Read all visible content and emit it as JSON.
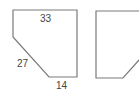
{
  "diagram": {
    "shapes": [
      {
        "id": "shape-1",
        "points": [
          [
            13,
            10
          ],
          [
            77,
            10
          ],
          [
            77,
            77
          ],
          [
            49,
            77
          ],
          [
            13,
            37
          ]
        ],
        "labels": [
          {
            "text": "33",
            "x": 40,
            "y": 22,
            "edge": "top"
          },
          {
            "text": "27",
            "x": 17,
            "y": 67,
            "edge": "diagonal"
          },
          {
            "text": "14",
            "x": 56,
            "y": 89,
            "edge": "bottom"
          }
        ]
      },
      {
        "id": "shape-2",
        "points": [
          [
            96,
            11
          ],
          [
            139,
            11
          ],
          [
            139,
            60
          ],
          [
            123,
            78
          ],
          [
            96,
            78
          ]
        ],
        "labels": []
      }
    ],
    "colors": {
      "stroke": "#7a7a7a",
      "text": "#444444",
      "background": "#ffffff"
    }
  }
}
